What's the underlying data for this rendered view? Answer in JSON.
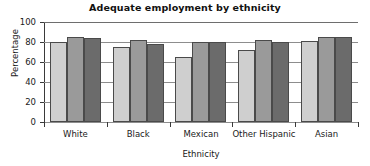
{
  "chart_data": {
    "type": "bar",
    "title": "Adequate employment by ethnicity",
    "xlabel": "Ethnicity",
    "ylabel": "Percentage",
    "categories": [
      "White",
      "Black",
      "Mexican",
      "Other Hispanic",
      "Asian"
    ],
    "series": [
      {
        "name": "series-1",
        "color": "#cfcfcf",
        "values": [
          80,
          75,
          65,
          72,
          81
        ]
      },
      {
        "name": "series-2",
        "color": "#9a9a9a",
        "values": [
          85,
          82,
          80,
          82,
          85
        ]
      },
      {
        "name": "series-3",
        "color": "#6b6b6b",
        "values": [
          84,
          78,
          80,
          80,
          85
        ]
      }
    ],
    "ylim": [
      0,
      100
    ],
    "yticks": [
      0,
      20,
      40,
      60,
      80,
      100
    ],
    "ytick_labels": [
      "0",
      "20",
      "40",
      "60",
      "80",
      "100"
    ],
    "grid": true,
    "legend": "none",
    "axis_color": "#3a3a3a",
    "grid_color": "#8d8d8d",
    "bar_edge_color": "#4a4a4a",
    "background": "#ffffff"
  }
}
